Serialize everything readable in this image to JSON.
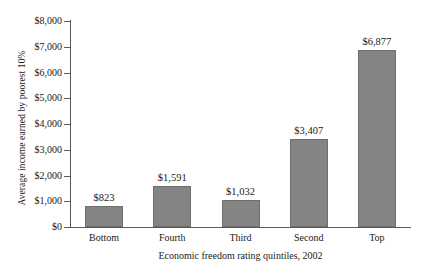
{
  "chart_data": {
    "type": "bar",
    "title": "",
    "categories": [
      "Bottom",
      "Fourth",
      "Third",
      "Second",
      "Top"
    ],
    "values": [
      823,
      1591,
      1032,
      3407,
      6877
    ],
    "value_labels": [
      "$823",
      "$1,591",
      "$1,032",
      "$3,407",
      "$6,877"
    ],
    "xlabel": "Economic freedom rating quintiles, 2002",
    "ylabel": "Average income earned by poorest 10%",
    "ylim": [
      0,
      8000
    ],
    "ytick_values": [
      0,
      1000,
      2000,
      3000,
      4000,
      5000,
      6000,
      7000,
      8000
    ],
    "ytick_labels": [
      "$0",
      "$1,000",
      "$2,000",
      "$3,000",
      "$4,000",
      "$5,000",
      "$6,000",
      "$7,000",
      "$8,000"
    ],
    "grid": false,
    "legend": "none",
    "bar_color": "#848484",
    "bar_edge_color": "#6e6e6e",
    "axis_color": "#5a5a5a",
    "background_color": "#ffffff"
  }
}
